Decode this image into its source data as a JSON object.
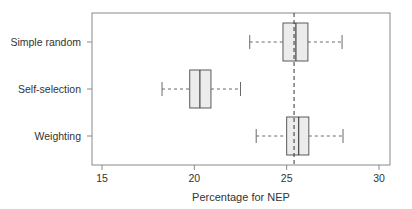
{
  "chart_data": {
    "type": "boxplot",
    "orientation": "horizontal",
    "title": "",
    "xlabel": "Percentage for NEP",
    "ylabel": "",
    "xlim": [
      14.5,
      30.6
    ],
    "x_ticks": [
      15,
      20,
      25,
      30
    ],
    "reference_line": {
      "value": 25.4,
      "style": "dashed"
    },
    "grid": false,
    "legend": null,
    "categories": [
      "Simple random",
      "Self-selection",
      "Weighting"
    ],
    "series": [
      {
        "name": "Simple random",
        "whisker_low": 23.0,
        "q1": 24.8,
        "median": 25.5,
        "q3": 26.15,
        "whisker_high": 28.0
      },
      {
        "name": "Self-selection",
        "whisker_low": 18.25,
        "q1": 19.75,
        "median": 20.3,
        "q3": 20.9,
        "whisker_high": 22.5
      },
      {
        "name": "Weighting",
        "whisker_low": 23.35,
        "q1": 25.0,
        "median": 25.65,
        "q3": 26.2,
        "whisker_high": 28.05
      }
    ]
  },
  "colors": {
    "frame": "#8a8a8a",
    "box_fill": "#ececec",
    "box_stroke": "#5a5a5a",
    "median": "#444444",
    "whisker": "#6a6a6a",
    "reference_line": "#333333",
    "text": "#333333"
  }
}
